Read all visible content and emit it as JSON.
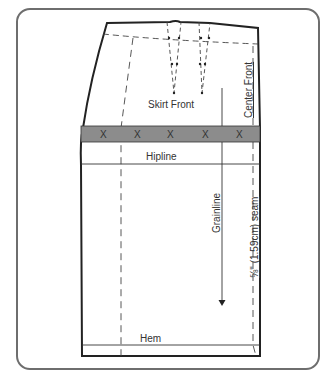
{
  "diagram": {
    "title": "Skirt Front",
    "labels": {
      "piece_name": "Skirt Front",
      "center_front": "Center Front",
      "hipline": "Hipline",
      "grainline": "Grainline",
      "seam_allowance": "⅝\" (1.59cm) seam",
      "hem": "Hem"
    },
    "band_marks": [
      "X",
      "X",
      "X",
      "X",
      "X"
    ],
    "colors": {
      "frame": "#6e6e6e",
      "outline": "#222222",
      "band": "#8c8c8c",
      "text": "#333333"
    }
  }
}
